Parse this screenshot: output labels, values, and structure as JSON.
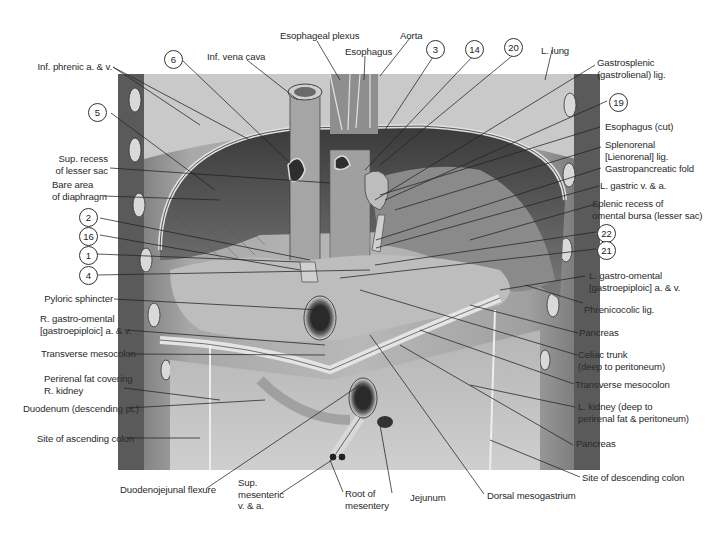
{
  "figure": {
    "colors": {
      "background": "#ffffff",
      "illustration_base": "#9a9a9a",
      "shadow": "#3e3e3e",
      "highlight": "#d8d8d8",
      "leader_line": "#222222"
    }
  },
  "labels_left": [
    {
      "id": "inf-phrenic",
      "text": "Inf. phrenic a. & v."
    },
    {
      "id": "n5",
      "text": "5"
    },
    {
      "id": "sup-recess",
      "line1": "Sup. recess",
      "line2": "of lesser sac"
    },
    {
      "id": "bare-area",
      "line1": "Bare area",
      "line2": "of diaphragm"
    },
    {
      "id": "n2",
      "text": "2"
    },
    {
      "id": "n16",
      "text": "16"
    },
    {
      "id": "n1",
      "text": "1"
    },
    {
      "id": "n4",
      "text": "4"
    },
    {
      "id": "pyloric",
      "text": "Pyloric sphincter"
    },
    {
      "id": "r-gastro",
      "line1": "R. gastro-omental",
      "line2": "[gastroepiploic] a. & v."
    },
    {
      "id": "transverse-l",
      "text": "Transverse mesocolon"
    },
    {
      "id": "perirenal",
      "line1": "Perirenal fat covering",
      "line2": "R. kidney"
    },
    {
      "id": "duodenum",
      "text": "Duodenum (descending pt.)"
    },
    {
      "id": "ascending",
      "text": "Site of ascending colon"
    }
  ],
  "labels_top": [
    {
      "id": "n6",
      "text": "6"
    },
    {
      "id": "ivc",
      "text": "Inf. vena cava"
    },
    {
      "id": "esoph-plexus",
      "text": "Esophageal plexus"
    },
    {
      "id": "esophagus",
      "text": "Esophagus"
    },
    {
      "id": "aorta",
      "text": "Aorta"
    },
    {
      "id": "n3",
      "text": "3"
    },
    {
      "id": "n14",
      "text": "14"
    },
    {
      "id": "n20",
      "text": "20"
    },
    {
      "id": "l-lung",
      "text": "L. lung"
    }
  ],
  "labels_right": [
    {
      "id": "gastrosplenic",
      "line1": "Gastrosplenic",
      "line2": "(gastrolienal) lig."
    },
    {
      "id": "n19",
      "text": "19"
    },
    {
      "id": "esoph-cut",
      "text": "Esophagus (cut)"
    },
    {
      "id": "splenorenal",
      "line1": "Splenorenal",
      "line2": "[Lienorenal] lig."
    },
    {
      "id": "gastropancreatic",
      "text": "Gastropancreatic fold"
    },
    {
      "id": "l-gastric",
      "text": "L. gastric v. & a."
    },
    {
      "id": "splenic-recess",
      "line1": "Splenic recess of",
      "line2": "omental bursa (lesser sac)"
    },
    {
      "id": "n22",
      "text": "22"
    },
    {
      "id": "n21",
      "text": "21"
    },
    {
      "id": "l-gastro",
      "line1": "L. gastro-omental",
      "line2": "[gastroepiploic] a. & v."
    },
    {
      "id": "phrenicocolic",
      "text": "Phrenicocolic lig."
    },
    {
      "id": "pancreas1",
      "text": "Pancreas"
    },
    {
      "id": "celiac",
      "line1": "Celiac trunk",
      "line2": "(deep to peritoneum)"
    },
    {
      "id": "transverse-r",
      "text": "Transverse mesocolon"
    },
    {
      "id": "l-kidney",
      "line1": "L. kidney (deep to",
      "line2": "perirenal fat & peritoneum)"
    },
    {
      "id": "pancreas2",
      "text": "Pancreas"
    },
    {
      "id": "descending",
      "text": "Site of descending colon"
    }
  ],
  "labels_bottom": [
    {
      "id": "duodenojejunal",
      "text": "Duodenojejunal flexure"
    },
    {
      "id": "sup-mesenteric",
      "line1": "Sup.",
      "line2": "mesenteric",
      "line3": "v. & a."
    },
    {
      "id": "root",
      "line1": "Root of",
      "line2": "mesentery"
    },
    {
      "id": "jejunum",
      "text": "Jejunum"
    },
    {
      "id": "dorsal",
      "text": "Dorsal mesogastrium"
    }
  ]
}
